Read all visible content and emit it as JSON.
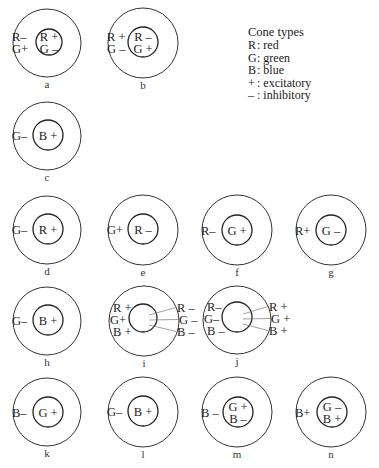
{
  "legend": {
    "title": "Cone types",
    "items": [
      {
        "symbol": "R",
        "meaning": ": red"
      },
      {
        "symbol": "G",
        "meaning": ": green"
      },
      {
        "symbol": "B",
        "meaning": ": blue"
      },
      {
        "symbol": "+",
        "meaning": ": excitatory"
      },
      {
        "symbol": "–",
        "meaning": ": inhibitory"
      }
    ]
  },
  "cells": [
    {
      "id": "a",
      "cx": 47,
      "cy": 43,
      "R": 34,
      "ir": 13,
      "icx": 49,
      "icy": 42,
      "center": [
        "R +",
        "G –"
      ],
      "surround_left": [
        "R–",
        "G+"
      ],
      "surround_right": [],
      "connectors": false
    },
    {
      "id": "b",
      "cx": 143,
      "cy": 43,
      "R": 35,
      "ir": 15,
      "icx": 143,
      "icy": 42,
      "center": [
        "R –",
        "G +"
      ],
      "surround_left": [
        "R +",
        "G –"
      ],
      "surround_right": [],
      "connectors": false
    },
    {
      "id": "c",
      "cx": 47,
      "cy": 136,
      "R": 34,
      "ir": 15,
      "icx": 48,
      "icy": 135,
      "center": [
        "B +"
      ],
      "surround_left": [
        "G–"
      ],
      "surround_right": [],
      "connectors": false
    },
    {
      "id": "d",
      "cx": 47,
      "cy": 230,
      "R": 34,
      "ir": 15,
      "icx": 48,
      "icy": 229,
      "center": [
        "R +"
      ],
      "surround_left": [
        "G–"
      ],
      "surround_right": [],
      "connectors": false
    },
    {
      "id": "e",
      "cx": 143,
      "cy": 230,
      "R": 35,
      "ir": 15,
      "icx": 143,
      "icy": 229,
      "center": [
        "R –"
      ],
      "surround_left": [
        "G+"
      ],
      "surround_right": [],
      "connectors": false
    },
    {
      "id": "f",
      "cx": 237,
      "cy": 230,
      "R": 35,
      "ir": 15,
      "icx": 237,
      "icy": 230,
      "center": [
        "G +"
      ],
      "surround_left": [
        "R–"
      ],
      "surround_right": [],
      "connectors": false
    },
    {
      "id": "g",
      "cx": 331,
      "cy": 230,
      "R": 35,
      "ir": 15,
      "icx": 331,
      "icy": 230,
      "center": [
        "G –"
      ],
      "surround_left": [
        "R+"
      ],
      "surround_right": [],
      "connectors": false
    },
    {
      "id": "h",
      "cx": 47,
      "cy": 321,
      "R": 34,
      "ir": 15,
      "icx": 48,
      "icy": 320,
      "center": [
        "B +"
      ],
      "surround_left": [
        "G–"
      ],
      "surround_right": [],
      "connectors": false
    },
    {
      "id": "i",
      "cx": 144,
      "cy": 321,
      "R": 35,
      "ir": 14,
      "icx": 143,
      "icy": 318,
      "center": [],
      "surround_left": [
        "R +",
        "G+",
        "B +"
      ],
      "surround_right": [
        "R –",
        "G –",
        "B –"
      ],
      "connectors": true
    },
    {
      "id": "j",
      "cx": 237,
      "cy": 320,
      "R": 34,
      "ir": 15,
      "icx": 237,
      "icy": 317,
      "center": [],
      "surround_left": [
        "R–",
        "G–",
        "B –"
      ],
      "surround_right": [
        "R +",
        "G +",
        "B +"
      ],
      "connectors": true
    },
    {
      "id": "k",
      "cx": 47,
      "cy": 412,
      "R": 34,
      "ir": 15,
      "icx": 48,
      "icy": 412,
      "center": [
        "G +"
      ],
      "surround_left": [
        "B–"
      ],
      "surround_right": [],
      "connectors": false
    },
    {
      "id": "l",
      "cx": 143,
      "cy": 412,
      "R": 35,
      "ir": 15,
      "icx": 143,
      "icy": 411,
      "center": [
        "B +"
      ],
      "surround_left": [
        "G–"
      ],
      "surround_right": [],
      "connectors": false
    },
    {
      "id": "m",
      "cx": 237,
      "cy": 412,
      "R": 35,
      "ir": 15,
      "icx": 238,
      "icy": 412,
      "center": [
        "G +",
        "B –"
      ],
      "surround_left": [
        "B –"
      ],
      "surround_right": [],
      "connectors": false
    },
    {
      "id": "n",
      "cx": 331,
      "cy": 412,
      "R": 35,
      "ir": 15,
      "icx": 332,
      "icy": 412,
      "center": [
        "G –",
        "B +"
      ],
      "surround_left": [
        "B+"
      ],
      "surround_right": [],
      "connectors": false
    }
  ]
}
